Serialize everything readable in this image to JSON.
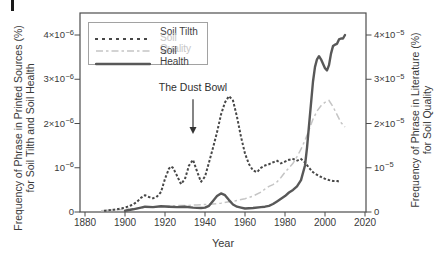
{
  "figure": {
    "background": "#ffffff"
  },
  "axes": {
    "left": {
      "label_line1": "Frequency of Phrase in Printed Sources (%)",
      "label_line2": "for Soil Tilth and Soil Health",
      "ticks": [
        {
          "v": 4,
          "b": "4×10",
          "e": "−6"
        },
        {
          "v": 3,
          "b": "3×10",
          "e": "−6"
        },
        {
          "v": 2,
          "b": "2×10",
          "e": "−6"
        },
        {
          "v": 1,
          "b": "10",
          "e": "−6"
        },
        {
          "v": 0,
          "b": "0",
          "e": ""
        }
      ]
    },
    "right": {
      "label_line1": "Frequency of Phrase in Literature (%)",
      "label_line2": "for Soil Quality",
      "ticks": [
        {
          "v": 4,
          "b": "4×10",
          "e": "−5"
        },
        {
          "v": 3,
          "b": "3×10",
          "e": "−5"
        },
        {
          "v": 2,
          "b": "2×10",
          "e": "−5"
        },
        {
          "v": 1,
          "b": "10",
          "e": "−5"
        },
        {
          "v": 0,
          "b": "0",
          "e": ""
        }
      ]
    },
    "x": {
      "ticks": [
        1880,
        1900,
        1920,
        1940,
        1960,
        1980,
        2000,
        2020
      ]
    }
  },
  "legend": {
    "items": [
      {
        "label": "Soil Tilth",
        "style": "dotted",
        "text_color_class": "lt-dark"
      },
      {
        "label": "Soil Quality",
        "style": "dashdot",
        "text_color_class": "lt-light"
      },
      {
        "label": "Soil Health",
        "style": "solid",
        "text_color_class": "lt-dark"
      }
    ]
  },
  "colors": {
    "frame": "#4d4d4d",
    "tilth": "#474747",
    "quality": "#c5c5c5",
    "health": "#585858",
    "annotation_arrow": "#333333"
  },
  "chart_data": {
    "type": "line",
    "title": "",
    "xlabel": "Year",
    "x_range": [
      1877,
      2021
    ],
    "grid": false,
    "legend_position": "upper-left",
    "left_axis": {
      "label": "Frequency of Phrase in Printed Sources (%) for Soil Tilth and Soil Health",
      "unit": "1e-6",
      "tick_values": [
        0,
        1e-06,
        2e-06,
        3e-06,
        4e-06
      ],
      "range": [
        0,
        4.5e-06
      ]
    },
    "right_axis": {
      "label": "Frequency of Phrase in Literature (%) for Soil Quality",
      "unit": "1e-5",
      "tick_values": [
        0,
        1e-05,
        2e-05,
        3e-05,
        4e-05
      ],
      "range": [
        0,
        4.5e-05
      ]
    },
    "annotations": [
      {
        "text": "The Dust Bowl",
        "year": 1934,
        "text_value": 2.95,
        "arrow_from_value": 2.55,
        "arrow_to_value": 1.9
      }
    ],
    "series": [
      {
        "name": "Soil Quality",
        "axis": "right",
        "style": "dashdot",
        "unit": "1e-5",
        "points": [
          [
            1888,
            0.03
          ],
          [
            1892,
            0.04
          ],
          [
            1896,
            0.05
          ],
          [
            1900,
            0.06
          ],
          [
            1904,
            0.07
          ],
          [
            1908,
            0.09
          ],
          [
            1912,
            0.11
          ],
          [
            1916,
            0.12
          ],
          [
            1920,
            0.13
          ],
          [
            1924,
            0.14
          ],
          [
            1928,
            0.15
          ],
          [
            1932,
            0.15
          ],
          [
            1936,
            0.16
          ],
          [
            1940,
            0.17
          ],
          [
            1944,
            0.18
          ],
          [
            1948,
            0.2
          ],
          [
            1952,
            0.23
          ],
          [
            1956,
            0.26
          ],
          [
            1960,
            0.3
          ],
          [
            1964,
            0.36
          ],
          [
            1968,
            0.45
          ],
          [
            1970,
            0.52
          ],
          [
            1972,
            0.58
          ],
          [
            1974,
            0.62
          ],
          [
            1976,
            0.68
          ],
          [
            1978,
            0.78
          ],
          [
            1980,
            0.9
          ],
          [
            1982,
            1.0
          ],
          [
            1984,
            1.1
          ],
          [
            1986,
            1.25
          ],
          [
            1988,
            1.42
          ],
          [
            1990,
            1.62
          ],
          [
            1992,
            1.85
          ],
          [
            1994,
            2.1
          ],
          [
            1996,
            2.28
          ],
          [
            1998,
            2.4
          ],
          [
            2000,
            2.48
          ],
          [
            2002,
            2.52
          ],
          [
            2004,
            2.38
          ],
          [
            2006,
            2.2
          ],
          [
            2008,
            2.02
          ],
          [
            2010,
            1.92
          ]
        ]
      },
      {
        "name": "Soil Tilth",
        "axis": "left",
        "style": "dotted",
        "unit": "1e-6",
        "points": [
          [
            1890,
            0.03
          ],
          [
            1892,
            0.04
          ],
          [
            1894,
            0.05
          ],
          [
            1896,
            0.06
          ],
          [
            1898,
            0.08
          ],
          [
            1900,
            0.1
          ],
          [
            1902,
            0.13
          ],
          [
            1904,
            0.17
          ],
          [
            1906,
            0.23
          ],
          [
            1908,
            0.32
          ],
          [
            1910,
            0.38
          ],
          [
            1912,
            0.34
          ],
          [
            1914,
            0.31
          ],
          [
            1916,
            0.35
          ],
          [
            1918,
            0.45
          ],
          [
            1920,
            0.75
          ],
          [
            1922,
            0.98
          ],
          [
            1923,
            1.03
          ],
          [
            1924,
            1.0
          ],
          [
            1926,
            0.82
          ],
          [
            1928,
            0.63
          ],
          [
            1930,
            0.75
          ],
          [
            1932,
            1.05
          ],
          [
            1934,
            1.18
          ],
          [
            1936,
            0.92
          ],
          [
            1938,
            0.68
          ],
          [
            1940,
            0.8
          ],
          [
            1942,
            1.12
          ],
          [
            1944,
            1.45
          ],
          [
            1946,
            1.8
          ],
          [
            1948,
            2.2
          ],
          [
            1950,
            2.48
          ],
          [
            1952,
            2.62
          ],
          [
            1954,
            2.52
          ],
          [
            1956,
            2.15
          ],
          [
            1958,
            1.7
          ],
          [
            1960,
            1.32
          ],
          [
            1962,
            1.08
          ],
          [
            1964,
            0.94
          ],
          [
            1966,
            0.9
          ],
          [
            1968,
            1.0
          ],
          [
            1970,
            1.05
          ],
          [
            1972,
            1.08
          ],
          [
            1974,
            1.12
          ],
          [
            1976,
            1.16
          ],
          [
            1978,
            1.1
          ],
          [
            1980,
            1.14
          ],
          [
            1982,
            1.18
          ],
          [
            1984,
            1.2
          ],
          [
            1986,
            1.16
          ],
          [
            1988,
            1.2
          ],
          [
            1990,
            1.12
          ],
          [
            1992,
            1.0
          ],
          [
            1994,
            0.9
          ],
          [
            1996,
            0.84
          ],
          [
            1998,
            0.79
          ],
          [
            2000,
            0.75
          ],
          [
            2002,
            0.72
          ],
          [
            2004,
            0.7
          ],
          [
            2006,
            0.7
          ],
          [
            2008,
            0.68
          ]
        ]
      },
      {
        "name": "Soil Health",
        "axis": "left",
        "style": "solid",
        "unit": "1e-6",
        "points": [
          [
            1900,
            0.03
          ],
          [
            1904,
            0.06
          ],
          [
            1908,
            0.1
          ],
          [
            1910,
            0.12
          ],
          [
            1914,
            0.11
          ],
          [
            1918,
            0.13
          ],
          [
            1922,
            0.12
          ],
          [
            1926,
            0.11
          ],
          [
            1930,
            0.12
          ],
          [
            1934,
            0.1
          ],
          [
            1938,
            0.09
          ],
          [
            1940,
            0.1
          ],
          [
            1942,
            0.14
          ],
          [
            1944,
            0.25
          ],
          [
            1946,
            0.36
          ],
          [
            1948,
            0.42
          ],
          [
            1950,
            0.38
          ],
          [
            1952,
            0.27
          ],
          [
            1954,
            0.17
          ],
          [
            1956,
            0.12
          ],
          [
            1958,
            0.1
          ],
          [
            1960,
            0.08
          ],
          [
            1964,
            0.09
          ],
          [
            1968,
            0.11
          ],
          [
            1970,
            0.12
          ],
          [
            1972,
            0.14
          ],
          [
            1974,
            0.18
          ],
          [
            1976,
            0.24
          ],
          [
            1978,
            0.3
          ],
          [
            1980,
            0.36
          ],
          [
            1982,
            0.44
          ],
          [
            1984,
            0.5
          ],
          [
            1986,
            0.58
          ],
          [
            1988,
            0.72
          ],
          [
            1990,
            1.05
          ],
          [
            1991,
            1.45
          ],
          [
            1992,
            1.95
          ],
          [
            1993,
            2.45
          ],
          [
            1994,
            2.95
          ],
          [
            1995,
            3.28
          ],
          [
            1996,
            3.45
          ],
          [
            1997,
            3.52
          ],
          [
            1998,
            3.45
          ],
          [
            1999,
            3.35
          ],
          [
            2000,
            3.25
          ],
          [
            2001,
            3.2
          ],
          [
            2002,
            3.32
          ],
          [
            2003,
            3.58
          ],
          [
            2004,
            3.75
          ],
          [
            2005,
            3.78
          ],
          [
            2006,
            3.8
          ],
          [
            2007,
            3.9
          ],
          [
            2008,
            3.92
          ],
          [
            2009,
            3.92
          ],
          [
            2010,
            4.0
          ]
        ]
      }
    ]
  }
}
